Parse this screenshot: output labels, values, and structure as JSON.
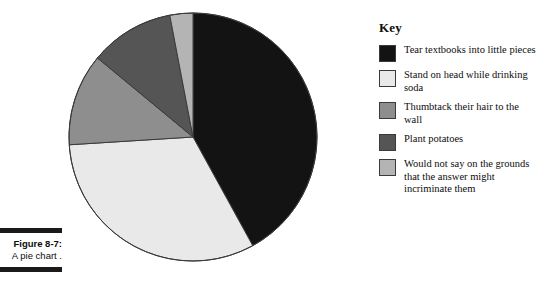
{
  "figure": {
    "number_label": "Figure 8-7:",
    "caption": "A pie chart ."
  },
  "legend": {
    "title": "Key"
  },
  "colors": {
    "slice_tear_textbooks": "#131313",
    "slice_stand_on_head": "#e9e9e9",
    "slice_thumbtack": "#8e8e8e",
    "slice_plant_potatoes": "#555555",
    "slice_would_not_say": "#b4b4b4",
    "outline": "#3a3a3a",
    "background": "#ffffff",
    "text": "#0d0d0d"
  },
  "chart_data": {
    "type": "pie",
    "title": "A pie chart .",
    "xlabel": "",
    "ylabel": "",
    "legend_position": "right",
    "legend_title": "Key",
    "grid": false,
    "start_angle_deg": 0,
    "direction": "clockwise",
    "categories": [
      "Tear textbooks into little pieces",
      "Stand on head while drinking soda",
      "Thumbtack their hair to the wall",
      "Plant potatoes",
      "Would not say on the grounds that the answer might incriminate them"
    ],
    "values": [
      42,
      32,
      12,
      11,
      3
    ],
    "units": "percent",
    "slices": [
      {
        "label": "Tear textbooks into little pieces",
        "value": 42,
        "color": "#131313",
        "start_angle_deg": 0,
        "end_angle_deg": 151.2
      },
      {
        "label": "Stand on head while drinking soda",
        "value": 32,
        "color": "#e9e9e9",
        "start_angle_deg": 151.2,
        "end_angle_deg": 266.4
      },
      {
        "label": "Thumbtack their hair to the wall",
        "value": 12,
        "color": "#8e8e8e",
        "start_angle_deg": 266.4,
        "end_angle_deg": 309.6
      },
      {
        "label": "Plant potatoes",
        "value": 11,
        "color": "#555555",
        "start_angle_deg": 309.6,
        "end_angle_deg": 349.2
      },
      {
        "label": "Would not say on the grounds that the answer might incriminate them",
        "value": 3,
        "color": "#b4b4b4",
        "start_angle_deg": 349.2,
        "end_angle_deg": 360
      }
    ]
  },
  "legend_items": [
    {
      "label": "Tear textbooks into little pieces",
      "color": "#131313",
      "icon": "swatch-icon"
    },
    {
      "label": "Stand on head while drinking soda",
      "color": "#e9e9e9",
      "icon": "swatch-icon"
    },
    {
      "label": "Thumbtack their hair to the wall",
      "color": "#8e8e8e",
      "icon": "swatch-icon"
    },
    {
      "label": "Plant potatoes",
      "color": "#555555",
      "icon": "swatch-icon"
    },
    {
      "label": "Would not say on the grounds that the answer might incriminate them",
      "color": "#b4b4b4",
      "icon": "swatch-icon"
    }
  ]
}
